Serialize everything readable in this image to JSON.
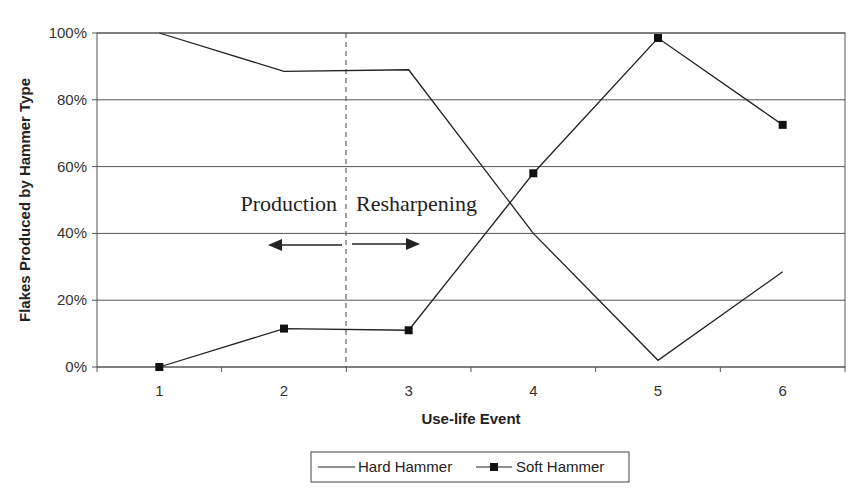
{
  "chart_data": {
    "type": "line",
    "title": "",
    "xlabel": "Use-life Event",
    "ylabel": "Flakes Produced by Hammer Type",
    "categories": [
      "1",
      "2",
      "3",
      "4",
      "5",
      "6"
    ],
    "series": [
      {
        "name": "Hard Hammer",
        "marker": "none",
        "values": [
          100,
          88.5,
          89,
          40,
          2,
          28.5
        ]
      },
      {
        "name": "Soft Hammer",
        "marker": "square",
        "values": [
          0,
          11.5,
          11,
          58,
          98.5,
          72.5
        ]
      }
    ],
    "ylim": [
      0,
      100
    ],
    "yticks": [
      "0%",
      "20%",
      "40%",
      "60%",
      "80%",
      "100%"
    ],
    "grid": true,
    "legend_position": "bottom",
    "annotations": [
      {
        "text": "Production",
        "arrow": "left"
      },
      {
        "text": "Resharpening",
        "arrow": "right"
      }
    ],
    "divider_between": [
      "2",
      "3"
    ]
  },
  "labels": {
    "xlabel": "Use-life Event",
    "ylabel": "Flakes Produced by Hammer Type",
    "production": "Production",
    "resharpening": "Resharpening",
    "legend_hard": "Hard Hammer",
    "legend_soft": "Soft Hammer"
  }
}
